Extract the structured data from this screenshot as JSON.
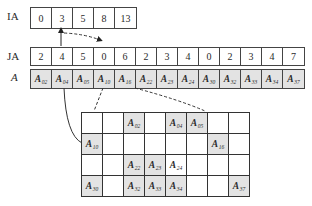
{
  "labels": {
    "ia": "IA",
    "ja": "JA",
    "a": "A"
  },
  "ia": [
    "0",
    "3",
    "5",
    "8",
    "13"
  ],
  "ja": [
    "2",
    "4",
    "5",
    "0",
    "6",
    "2",
    "3",
    "4",
    "0",
    "2",
    "3",
    "4",
    "7"
  ],
  "a": [
    {
      "base": "A",
      "sub": "02"
    },
    {
      "base": "A",
      "sub": "04"
    },
    {
      "base": "A",
      "sub": "05"
    },
    {
      "base": "A",
      "sub": "10"
    },
    {
      "base": "A",
      "sub": "16"
    },
    {
      "base": "A",
      "sub": "22"
    },
    {
      "base": "A",
      "sub": "23"
    },
    {
      "base": "A",
      "sub": "24"
    },
    {
      "base": "A",
      "sub": "30"
    },
    {
      "base": "A",
      "sub": "32"
    },
    {
      "base": "A",
      "sub": "33"
    },
    {
      "base": "A",
      "sub": "34"
    },
    {
      "base": "A",
      "sub": "37"
    }
  ],
  "matrix": {
    "rows": 4,
    "cols": 8,
    "entries": [
      {
        "row": 0,
        "col": 2,
        "base": "A",
        "sub": "02",
        "shaded": true
      },
      {
        "row": 0,
        "col": 4,
        "base": "A",
        "sub": "04",
        "shaded": true
      },
      {
        "row": 0,
        "col": 5,
        "base": "A",
        "sub": "05",
        "shaded": true
      },
      {
        "row": 1,
        "col": 0,
        "base": "A",
        "sub": "10",
        "shaded": true
      },
      {
        "row": 1,
        "col": 6,
        "base": "A",
        "sub": "16",
        "shaded": true
      },
      {
        "row": 2,
        "col": 2,
        "base": "A",
        "sub": "22",
        "shaded": true
      },
      {
        "row": 2,
        "col": 3,
        "base": "A",
        "sub": "23",
        "shaded": true
      },
      {
        "row": 2,
        "col": 4,
        "base": "A",
        "sub": "24",
        "shaded": false
      },
      {
        "row": 3,
        "col": 0,
        "base": "A",
        "sub": "30",
        "shaded": true
      },
      {
        "row": 3,
        "col": 2,
        "base": "A",
        "sub": "32",
        "shaded": true
      },
      {
        "row": 3,
        "col": 3,
        "base": "A",
        "sub": "33",
        "shaded": true
      },
      {
        "row": 3,
        "col": 4,
        "base": "A",
        "sub": "34",
        "shaded": true
      },
      {
        "row": 3,
        "col": 7,
        "base": "A",
        "sub": "37",
        "shaded": true
      }
    ]
  },
  "colors": {
    "shaded": "#e3e3e3",
    "line": "#333333"
  }
}
